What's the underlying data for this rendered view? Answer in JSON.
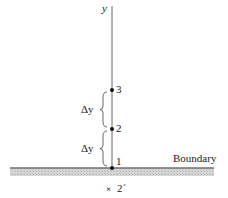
{
  "axis": {
    "label": "y",
    "x": 112,
    "y_top": 6,
    "y_bottom": 168,
    "color": "#555555"
  },
  "points": [
    {
      "id": "1",
      "label": "1",
      "x": 112,
      "y": 168
    },
    {
      "id": "2",
      "label": "2",
      "x": 112,
      "y": 129
    },
    {
      "id": "3",
      "label": "3",
      "x": 112,
      "y": 90
    }
  ],
  "spacings": [
    {
      "label": "Δy",
      "from": "2",
      "to": "3",
      "y_top": 92,
      "y_bottom": 127
    },
    {
      "label": "Δy",
      "from": "1",
      "to": "2",
      "y_top": 131,
      "y_bottom": 166
    }
  ],
  "boundary": {
    "label": "Boundary",
    "x_start": 10,
    "x_end": 214,
    "y": 168,
    "thickness": 8,
    "line_color": "#777777",
    "fill_color": "#c8c8c8"
  },
  "ghost_point": {
    "label": "2´",
    "marker": "×",
    "x": 112,
    "y": 188
  }
}
